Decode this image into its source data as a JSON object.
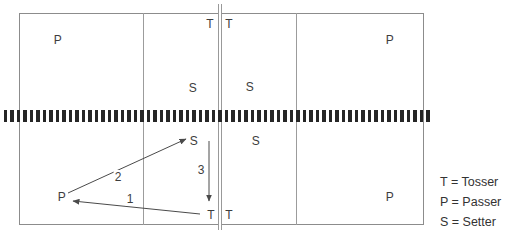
{
  "diagram": {
    "positions": [
      {
        "id": "passer-back-top-left",
        "label": "P",
        "x": 58,
        "y": 40
      },
      {
        "id": "tosser-top-left-of-center",
        "label": "T",
        "x": 210,
        "y": 24
      },
      {
        "id": "tosser-top-right-of-center",
        "label": "T",
        "x": 229,
        "y": 24
      },
      {
        "id": "setter-top-left-court",
        "label": "S",
        "x": 193,
        "y": 88
      },
      {
        "id": "setter-top-right-court",
        "label": "S",
        "x": 250,
        "y": 87
      },
      {
        "id": "passer-back-top-right",
        "label": "P",
        "x": 390,
        "y": 40
      },
      {
        "id": "setter-bottom-left-court",
        "label": "S",
        "x": 194,
        "y": 141
      },
      {
        "id": "setter-bottom-right-court",
        "label": "S",
        "x": 256,
        "y": 141
      },
      {
        "id": "passer-bottom-left",
        "label": "P",
        "x": 62,
        "y": 197
      },
      {
        "id": "tosser-bottom-left-of-center",
        "label": "T",
        "x": 211,
        "y": 215
      },
      {
        "id": "tosser-bottom-right-of-center",
        "label": "T",
        "x": 229,
        "y": 215
      },
      {
        "id": "passer-bottom-right",
        "label": "P",
        "x": 390,
        "y": 197
      }
    ],
    "arrows": [
      {
        "number": "1",
        "from": {
          "x": 200,
          "y": 214
        },
        "to": {
          "x": 73,
          "y": 201
        },
        "label_pos": {
          "x": 130,
          "y": 199
        }
      },
      {
        "number": "2",
        "from": {
          "x": 68,
          "y": 193
        },
        "to": {
          "x": 186,
          "y": 139
        },
        "label_pos": {
          "x": 118,
          "y": 177
        }
      },
      {
        "number": "3",
        "from": {
          "x": 209,
          "y": 141
        },
        "to": {
          "x": 209,
          "y": 201
        },
        "label_pos": {
          "x": 201,
          "y": 170
        }
      }
    ],
    "legend": {
      "items": [
        {
          "id": "tosser",
          "label": "T = Tosser"
        },
        {
          "id": "passer",
          "label": "P = Passer"
        },
        {
          "id": "setter",
          "label": "S = Setter"
        }
      ]
    }
  }
}
